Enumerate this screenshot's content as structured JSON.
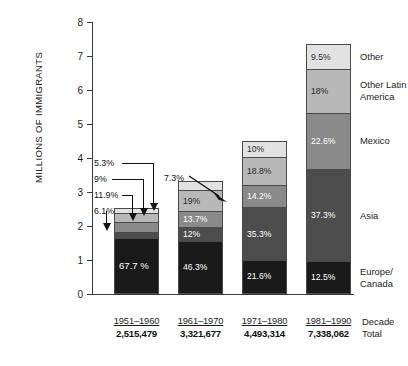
{
  "chart_data": {
    "type": "bar",
    "title": "",
    "subtype": "stacked-percentage",
    "xlabel": "Decade",
    "ylabel": "MILLIONS OF IMMIGRANTS",
    "ylim": [
      0,
      8
    ],
    "yticks": [
      "0",
      "1",
      "2",
      "3",
      "4",
      "5",
      "6",
      "7",
      "8"
    ],
    "grid": false,
    "legend_position": "right",
    "categories": [
      "1951-1960",
      "1961-1970",
      "1971-1980",
      "1981-1990"
    ],
    "totals": [
      "2,515,479",
      "3,321,677",
      "4,493,314",
      "7,338,062"
    ],
    "totals_millions": [
      2.515479,
      3.321677,
      4.493314,
      7.338062
    ],
    "series": [
      {
        "name": "Europe/\nCanada",
        "color": "#1a1a1a",
        "values": [
          67.7,
          46.3,
          21.6,
          12.5
        ],
        "labels": [
          "67.7\n%",
          "46.3%",
          "21.6%",
          "12.5%"
        ]
      },
      {
        "name": "Asia",
        "color": "#4d4d4d",
        "values": [
          6.1,
          12,
          35.3,
          37.3
        ],
        "labels": [
          "6.1%",
          "12%",
          "35.3%",
          "37.3%"
        ]
      },
      {
        "name": "Mexico",
        "color": "#8a8a8a",
        "values": [
          11.9,
          13.7,
          14.2,
          22.6
        ],
        "labels": [
          "11.9%",
          "13.7%",
          "14.2%",
          "22.6%"
        ]
      },
      {
        "name": "Other Latin\nAmerica",
        "color": "#b8b8b8",
        "values": [
          9,
          19,
          18.8,
          18
        ],
        "labels": [
          "9%",
          "19%",
          "18.8%",
          "18%"
        ]
      },
      {
        "name": "Other",
        "color": "#e2e2e2",
        "values": [
          5.3,
          7.3,
          10,
          9.5
        ],
        "labels": [
          "5.3%",
          "7.3%",
          "10%",
          "9.5%"
        ]
      }
    ],
    "callouts": [
      {
        "text": "5.3%",
        "bar": 1,
        "segment": "Other"
      },
      {
        "text": "9%",
        "bar": 1,
        "segment": "Other Latin America"
      },
      {
        "text": "11.9%",
        "bar": 1,
        "segment": "Mexico"
      },
      {
        "text": "6.1%",
        "bar": 1,
        "segment": "Asia"
      },
      {
        "text": "7.3%",
        "bar": 2,
        "segment": "Other"
      }
    ]
  },
  "axis": {
    "y_title": "MILLIONS OF IMMIGRANTS",
    "y_ticks": [
      "8",
      "7",
      "6",
      "5",
      "4",
      "3",
      "2",
      "1",
      "0"
    ]
  },
  "legend": {
    "items": [
      {
        "label": "Other"
      },
      {
        "label": "Other Latin\nAmerica"
      },
      {
        "label": "Mexico"
      },
      {
        "label": "Asia"
      },
      {
        "label": "Europe/\nCanada"
      }
    ]
  },
  "xaxis": {
    "caption": "Decade\nTotal",
    "groups": [
      {
        "decade": "1951–1960",
        "total": "2,515,479"
      },
      {
        "decade": "1961–1970",
        "total": "3,321,677"
      },
      {
        "decade": "1971–1980",
        "total": "4,493,314"
      },
      {
        "decade": "1981–1990",
        "total": "7,338,062"
      }
    ]
  }
}
